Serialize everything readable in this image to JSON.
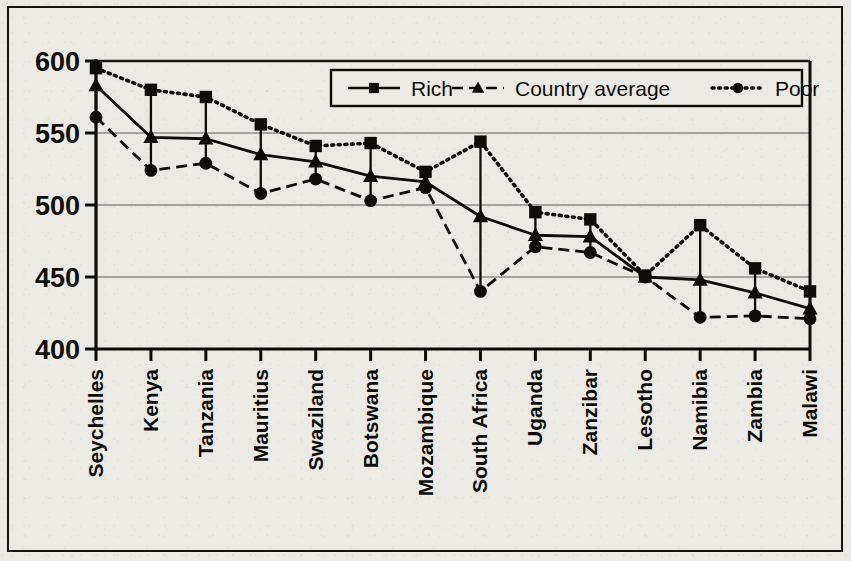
{
  "chart_data": {
    "type": "line",
    "title": "",
    "subtitle": "",
    "xlabel": "",
    "ylabel": "",
    "ylim": [
      400,
      600
    ],
    "yticks": [
      400,
      450,
      500,
      550,
      600
    ],
    "ytick_labels": [
      "400",
      "450",
      "500",
      "550",
      "600"
    ],
    "grid": true,
    "grid_axis": "y",
    "legend_position": "top-center",
    "categories": [
      "Seychelles",
      "Kenya",
      "Tanzania",
      "Mauritius",
      "Swaziland",
      "Botswana",
      "Mozambique",
      "South Africa",
      "Uganda",
      "Zanzibar",
      "Lesotho",
      "Namibia",
      "Zambia",
      "Malawi"
    ],
    "series": [
      {
        "name": "Rich",
        "marker": "square",
        "line_style": "dotted",
        "color": "#0d0c08",
        "values": [
          595,
          580,
          575,
          556,
          541,
          543,
          523,
          544,
          495,
          490,
          451,
          486,
          456,
          440
        ]
      },
      {
        "name": "Country average",
        "marker": "triangle",
        "line_style": "solid",
        "color": "#0d0c08",
        "values": [
          583,
          547,
          546,
          535,
          530,
          520,
          516,
          492,
          479,
          478,
          450,
          448,
          439,
          428
        ]
      },
      {
        "name": "Poor",
        "marker": "circle",
        "line_style": "dashed",
        "color": "#0d0c08",
        "values": [
          561,
          524,
          529,
          508,
          518,
          503,
          512,
          440,
          471,
          467,
          450,
          422,
          423,
          421
        ]
      }
    ]
  },
  "legend": {
    "entries": [
      {
        "label": "Rich",
        "marker": "square",
        "line_style": "solid"
      },
      {
        "label": "Country average",
        "marker": "triangle",
        "line_style": "dashed"
      },
      {
        "label": "Poor",
        "marker": "circle",
        "line_style": "dotted"
      }
    ]
  },
  "axis": {
    "y_tick_labels": [
      "600",
      "550",
      "500",
      "450",
      "400"
    ]
  }
}
